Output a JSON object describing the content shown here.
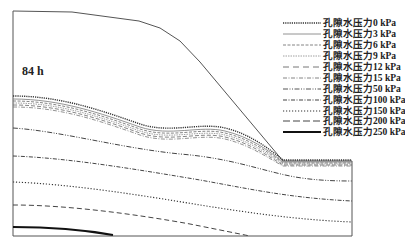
{
  "figure": {
    "time_label": "84 h",
    "legend": [
      {
        "label": "孔隙水压力0 kPa",
        "style": "dotted-heavy"
      },
      {
        "label": "孔隙水压力3 kPa",
        "style": "thin-solid"
      },
      {
        "label": "孔隙水压力6 kPa",
        "style": "short-dash"
      },
      {
        "label": "孔隙水压力9 kPa",
        "style": "fine-dash"
      },
      {
        "label": "孔隙水压力12 kPa",
        "style": "long-dash"
      },
      {
        "label": "孔隙水压力15 kPa",
        "style": "dash-dot"
      },
      {
        "label": "孔隙水压力50 kPa",
        "style": "dash-dot-dot"
      },
      {
        "label": "孔隙水压力100 kPa",
        "style": "dash-dot-heavy"
      },
      {
        "label": "孔隙水压力150 kPa",
        "style": "dotted"
      },
      {
        "label": "孔隙水压力200 kPa",
        "style": "dashed"
      },
      {
        "label": "孔隙水压力250 kPa",
        "style": "solid-heavy"
      }
    ]
  }
}
